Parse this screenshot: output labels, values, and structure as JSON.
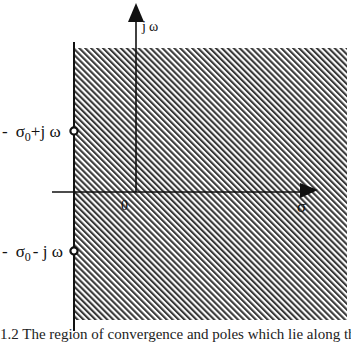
{
  "diagram": {
    "type": "complex-plane",
    "axes": {
      "imag_label_j": "j",
      "imag_label_omega": "ω",
      "real_label": "σ",
      "origin_label": "0"
    },
    "points": [
      {
        "id": "upper-pole",
        "label_prefix": "-",
        "label_sigma": "σ",
        "label_sub": "0",
        "label_suffix": "+j ω"
      },
      {
        "id": "lower-pole",
        "label_prefix": "-",
        "label_sigma": "σ",
        "label_sub": "0",
        "label_suffix": "- j ω"
      }
    ],
    "region": {
      "description": "hatched region of convergence to the right of -σ0",
      "fill": "diagonal-hatch"
    },
    "colors": {
      "ink": "#111111",
      "background": "#ffffff"
    }
  },
  "caption": {
    "text": "  1.2  The region of convergence  and poles  which  lie  along  the"
  }
}
